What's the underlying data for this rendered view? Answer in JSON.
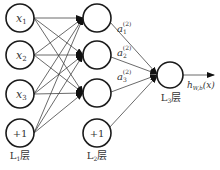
{
  "diagram": {
    "layers": [
      {
        "id": "L1",
        "label": "L",
        "label_sub": "1",
        "label_suffix": "层",
        "nodes": [
          {
            "text": "x",
            "sub": "1"
          },
          {
            "text": "x",
            "sub": "2"
          },
          {
            "text": "x",
            "sub": "3"
          },
          {
            "text": "+1",
            "sub": ""
          }
        ]
      },
      {
        "id": "L2",
        "label": "L",
        "label_sub": "2",
        "label_suffix": "层",
        "nodes": [
          {
            "text": "",
            "sub": ""
          },
          {
            "text": "",
            "sub": ""
          },
          {
            "text": "",
            "sub": ""
          },
          {
            "text": "+1",
            "sub": ""
          }
        ]
      },
      {
        "id": "L3",
        "label": "L",
        "label_sub": "3",
        "label_suffix": "层",
        "nodes": [
          {
            "text": "",
            "sub": ""
          }
        ]
      }
    ],
    "activations": [
      {
        "base": "a",
        "sub": "1",
        "sup": "(2)"
      },
      {
        "base": "a",
        "sub": "2",
        "sup": "(2)"
      },
      {
        "base": "a",
        "sub": "3",
        "sup": "(2)"
      }
    ],
    "output": {
      "base": "h",
      "sub": "W,b",
      "arg": "(x)"
    },
    "colors": {
      "stroke": "#1a1a1a",
      "edge": "#444444",
      "text": "#333333",
      "background": "#ffffff"
    }
  }
}
